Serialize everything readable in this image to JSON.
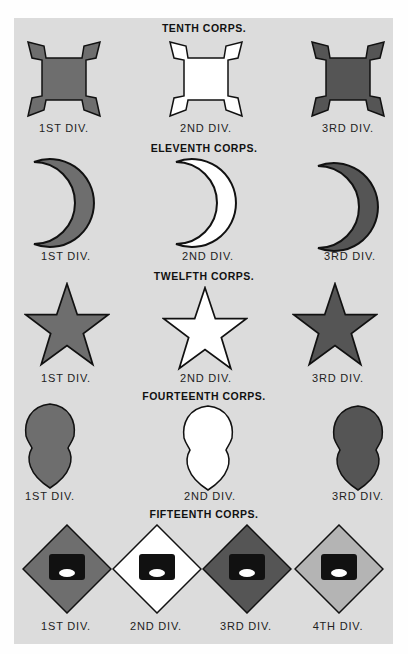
{
  "corps": [
    {
      "title": "TENTH CORPS.",
      "shape": "square-notched",
      "divisions": [
        {
          "label": "1ST DIV.",
          "color": "#6e6e6e"
        },
        {
          "label": "2ND DIV.",
          "color": "#ffffff"
        },
        {
          "label": "3RD DIV.",
          "color": "#555555"
        }
      ]
    },
    {
      "title": "ELEVENTH CORPS.",
      "shape": "crescent",
      "divisions": [
        {
          "label": "1ST DIV.",
          "color": "#6e6e6e"
        },
        {
          "label": "2ND DIV.",
          "color": "#ffffff"
        },
        {
          "label": "3RD DIV.",
          "color": "#555555"
        }
      ]
    },
    {
      "title": "TWELFTH CORPS.",
      "shape": "star",
      "divisions": [
        {
          "label": "1ST DIV.",
          "color": "#6e6e6e"
        },
        {
          "label": "2ND DIV.",
          "color": "#ffffff"
        },
        {
          "label": "3RD DIV.",
          "color": "#555555"
        }
      ]
    },
    {
      "title": "FOURTEENTH CORPS.",
      "shape": "acorn",
      "divisions": [
        {
          "label": "1ST DIV.",
          "color": "#6e6e6e"
        },
        {
          "label": "2ND DIV.",
          "color": "#ffffff"
        },
        {
          "label": "3RD DIV.",
          "color": "#555555"
        }
      ]
    },
    {
      "title": "FIFTEENTH CORPS.",
      "shape": "diamond-cartridge-box",
      "box_text": "40 ROUNDS",
      "box_oval": "U.S.",
      "divisions": [
        {
          "label": "1ST DIV.",
          "color": "#6e6e6e"
        },
        {
          "label": "2ND DIV.",
          "color": "#ffffff"
        },
        {
          "label": "3RD DIV.",
          "color": "#555555"
        },
        {
          "label": "4TH DIV.",
          "color": "#b4b4b4"
        }
      ]
    }
  ]
}
